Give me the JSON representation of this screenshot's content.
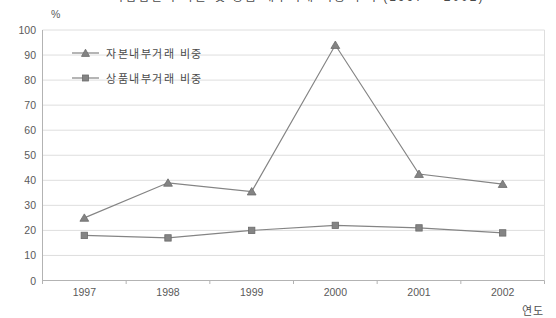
{
  "cropped_title": {
    "text": "기업집단의 자본 및 상품 내부거래 비중 추이 (1997 ~ 2002)",
    "visibility": "bottom edge of title text cut off at top of image"
  },
  "chart_data": {
    "type": "line",
    "categories": [
      "1997",
      "1998",
      "1999",
      "2000",
      "2001",
      "2002"
    ],
    "series": [
      {
        "name": "자본내부거래 비중",
        "marker": "triangle",
        "values": [
          25,
          39,
          35.5,
          94,
          42.5,
          38.5
        ]
      },
      {
        "name": "상품내부거래 비중",
        "marker": "square",
        "values": [
          18,
          17,
          20,
          22,
          21,
          19
        ]
      }
    ],
    "ylabel_unit": "%",
    "xlabel": "연도",
    "ylim": [
      0,
      100
    ],
    "ytick_step": 10,
    "yticks": [
      "0",
      "10",
      "20",
      "30",
      "40",
      "50",
      "60",
      "70",
      "80",
      "90",
      "100"
    ],
    "grid": "horizontal",
    "legend_position": "inside-top-left",
    "colors": {
      "series": "#848484",
      "marker_edge": "#6b6b6b",
      "grid": "#dedede",
      "axis": "#b3b3b3",
      "text": "#5a5a5a"
    }
  }
}
